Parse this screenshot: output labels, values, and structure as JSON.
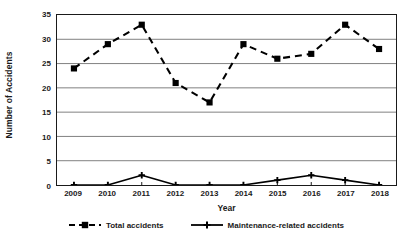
{
  "chart_data": {
    "type": "line",
    "title": "",
    "xlabel": "Year",
    "ylabel": "Number of Accidents",
    "categories": [
      "2009",
      "2010",
      "2011",
      "2012",
      "2013",
      "2014",
      "2015",
      "2016",
      "2017",
      "2018"
    ],
    "x": [
      2009,
      2010,
      2011,
      2012,
      2013,
      2014,
      2015,
      2016,
      2017,
      2018
    ],
    "series": [
      {
        "name": "Total accidents",
        "values": [
          24,
          29,
          33,
          21,
          17,
          29,
          26,
          27,
          33,
          28
        ],
        "line_style": "dashed",
        "marker": "square",
        "color": "#000000"
      },
      {
        "name": "Maintenance-related accidents",
        "values": [
          0,
          0,
          2,
          0,
          0,
          0,
          1,
          2,
          1,
          0
        ],
        "line_style": "solid",
        "marker": "cross",
        "color": "#000000"
      }
    ],
    "ylim": [
      0,
      35
    ],
    "y_ticks": [
      0,
      5,
      10,
      15,
      20,
      25,
      30,
      35
    ],
    "y_tick_labels": [
      "0",
      "5",
      "10",
      "15",
      "20",
      "25",
      "30",
      "35"
    ],
    "grid": "horizontal",
    "legend_position": "bottom",
    "plot_background": "#ffffff",
    "axis_color": "#1a1a1a",
    "grid_color": "#7f7f7f"
  },
  "legend": {
    "items": [
      {
        "label": "Total accidents",
        "marker_name": "dashed-square-marker"
      },
      {
        "label": "Maintenance-related accidents",
        "marker_name": "solid-cross-marker"
      }
    ]
  }
}
